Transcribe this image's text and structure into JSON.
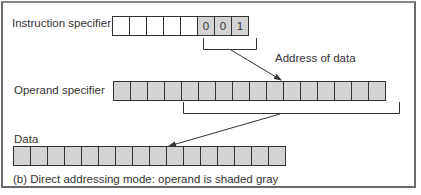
{
  "figure": {
    "caption": "(b) Direct addressing mode: operand is shaded gray",
    "colors": {
      "shaded": "#d3d3d3",
      "unshaded": "#ffffff",
      "stroke": "#333333"
    }
  },
  "instruction_specifier": {
    "label": "Instruction specifier",
    "cells": [
      "",
      "",
      "",
      "",
      "",
      "0",
      "0",
      "1"
    ],
    "shaded": [
      false,
      false,
      false,
      false,
      false,
      true,
      true,
      true
    ]
  },
  "address_annotation": {
    "label": "Address of data"
  },
  "operand_specifier": {
    "label": "Operand specifier",
    "cell_count": 16,
    "shaded": true
  },
  "data": {
    "label": "Data",
    "cell_count": 16,
    "shaded": true
  }
}
